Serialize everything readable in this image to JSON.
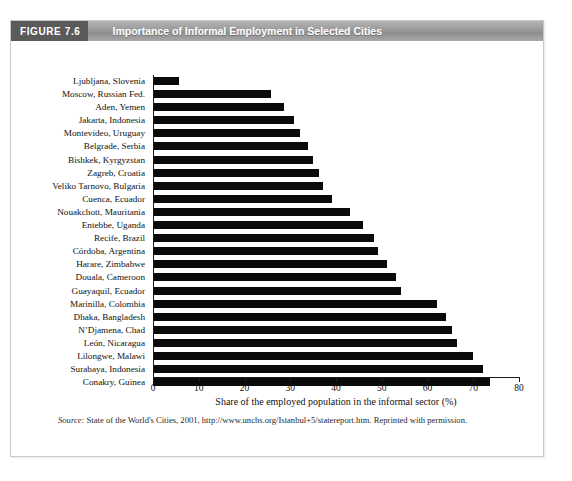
{
  "figure": {
    "number_label": "FIGURE 7.6",
    "title": "Importance of Informal Employment in Selected Cities",
    "source_label": "Source:",
    "source_text": " State of the World's Cities, 2001, http://www.unchs.org/Istanbul+5/statereport.htm. Reprinted with permission."
  },
  "chart_data": {
    "type": "bar",
    "orientation": "horizontal",
    "title": "Importance of Informal Employment in Selected Cities",
    "xlabel": "Share of the employed population in the informal sector (%)",
    "ylabel": "",
    "xlim": [
      0,
      80
    ],
    "xticks": [
      0,
      10,
      20,
      30,
      40,
      50,
      60,
      70,
      80
    ],
    "xtick_labels": [
      "0",
      "10",
      "20",
      "30",
      "40",
      "50",
      "60",
      "70",
      "80"
    ],
    "grid": false,
    "legend": null,
    "bar_color": "#0a0a0a",
    "categories": [
      "Ljubljana, Slovenia",
      "Moscow, Russian Fed.",
      "Aden, Yemen",
      "Jakarta, Indonesia",
      "Montevideo, Uruguay",
      "Belgrade, Serbia",
      "Bishkek, Kyrgyzstan",
      "Zagreb, Croatia",
      "Veliko Tarnovo, Bulgaria",
      "Cuenca, Ecuador",
      "Nouakchott, Mauritania",
      "Entebbe, Uganda",
      "Recife, Brazil",
      "Córdoba, Argentina",
      "Harare, Zimbabwe",
      "Douala, Cameroon",
      "Guayaquil, Ecuador",
      "Marinilla, Colombia",
      "Dhaka, Bangladesh",
      "N’Djamena, Chad",
      "León, Nicaragua",
      "Lilongwe, Malawi",
      "Surabaya, Indonesia",
      "Conakry, Guinea"
    ],
    "values": [
      5.7,
      25.8,
      28.6,
      30.8,
      32.1,
      33.9,
      34.9,
      36.3,
      37.1,
      39.2,
      43.1,
      45.9,
      48.3,
      49.2,
      51.1,
      53.1,
      54.2,
      62.1,
      64.0,
      65.4,
      66.4,
      70.0,
      72.1,
      73.7
    ]
  }
}
